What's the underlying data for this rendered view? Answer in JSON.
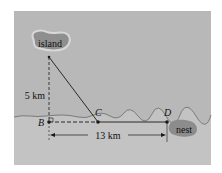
{
  "diagram": {
    "labels": {
      "island": "island",
      "nest": "nest",
      "B": "B",
      "C": "C",
      "D": "D",
      "vertical_distance": "5 km",
      "horizontal_distance": "13 km"
    },
    "colors": {
      "background": "#ffffff",
      "water": "#b8b8b8",
      "land": "#c2c2c2",
      "island_fill": "#8f8f8f",
      "island_halo": "#d8d8d8",
      "nest_fill": "#8c8c8c",
      "line": "#1a1a1a"
    }
  }
}
